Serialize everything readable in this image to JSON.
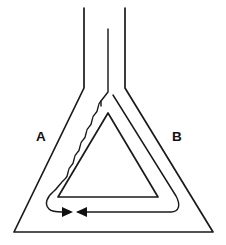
{
  "figure": {
    "background_color": "#ffffff",
    "line_color": "#1a1a1a",
    "labels": [
      {
        "id": "A",
        "text": "A",
        "x": 36,
        "y": 141
      },
      {
        "id": "B",
        "text": "B",
        "x": 172,
        "y": 141
      }
    ],
    "arrows": [
      {
        "id": "left-arrow",
        "direction": "right",
        "tip_x": 72,
        "tip_y": 212
      },
      {
        "id": "right-arrow",
        "direction": "left",
        "tip_x": 76,
        "tip_y": 212
      }
    ],
    "neck": {
      "left_x": 84,
      "middle_x": 108,
      "right_x": 125,
      "top_y": 8,
      "middle_top_y": 29
    },
    "outer_flask": {
      "apex_left_x": 84,
      "apex_right_x": 125,
      "bottom_left_x": 14,
      "bottom_right_x": 213,
      "bottom_y": 232
    },
    "inner_triangle": {
      "apex_x": 108,
      "apex_y": 113,
      "bottom_left_x": 58,
      "bottom_right_x": 158,
      "bottom_y": 197
    },
    "wavy_line": {
      "description": "wavy inner boundary on left side of flask",
      "amplitude": 5,
      "segments": 7
    }
  }
}
